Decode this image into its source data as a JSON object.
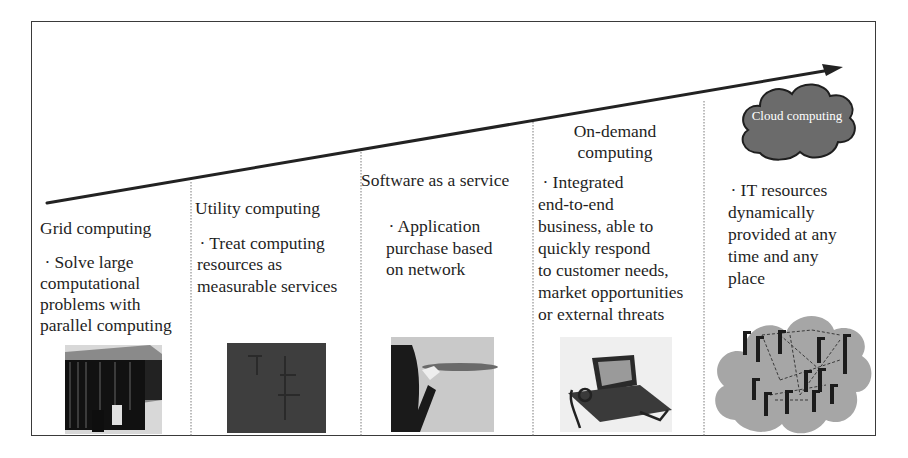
{
  "diagram": {
    "type": "evolution-timeline",
    "arrow": {
      "direction": "left-to-right-rising",
      "color": "#222222"
    },
    "cloud_badge": {
      "label": "Cloud computing",
      "fill": "#6e6e6e"
    },
    "stages": [
      {
        "title": "Grid computing",
        "bullet": "·",
        "description_lines": [
          "Solve large",
          "computational",
          "problems with",
          "parallel computing"
        ],
        "image": "supercomputer-racks"
      },
      {
        "title": "Utility computing",
        "bullet": "·",
        "description_lines": [
          "Treat computing",
          "resources as",
          "measurable services"
        ],
        "image": "utility-meter"
      },
      {
        "title": "Software as a service",
        "bullet": "·",
        "description_lines": [
          "Application",
          "purchase based",
          "on network"
        ],
        "image": "waiter-serving-tray"
      },
      {
        "title_lines": [
          "On-demand",
          "computing"
        ],
        "bullet": "·",
        "description_lines": [
          "Integrated",
          "end-to-end",
          "business, able to",
          "quickly respond",
          "to customer needs,",
          "market opportunities",
          "or external threats"
        ],
        "image": "laptop-with-robot"
      },
      {
        "title": "Cloud computing",
        "bullet": "·",
        "description_lines": [
          "IT resources",
          "dynamically",
          "provided at any",
          "time and any",
          "place"
        ],
        "image": "server-network-cloud"
      }
    ]
  },
  "text": {
    "s1_title": "Grid computing",
    "s1_l1": " · Solve large",
    "s1_l2": "computational",
    "s1_l3": "problems with",
    "s1_l4": "parallel computing",
    "s2_title": "Utility computing",
    "s2_l1": " · Treat computing",
    "s2_l2": "resources as",
    "s2_l3": "measurable services",
    "s3_title": "Software as a service",
    "s3_l1": " · Application",
    "s3_l2": "purchase based",
    "s3_l3": "on network",
    "s4_title1": "On-demand",
    "s4_title2": "computing",
    "s4_l1": " · Integrated",
    "s4_l2": "end-to-end",
    "s4_l3": "business, able to",
    "s4_l4": "quickly respond",
    "s4_l5": "to customer needs,",
    "s4_l6": "market opportunities",
    "s4_l7": "or external threats",
    "s5_cloud": "Cloud computing",
    "s5_l1": " · IT resources",
    "s5_l2": "dynamically",
    "s5_l3": "provided at any",
    "s5_l4": "time and any",
    "s5_l5": "place"
  }
}
